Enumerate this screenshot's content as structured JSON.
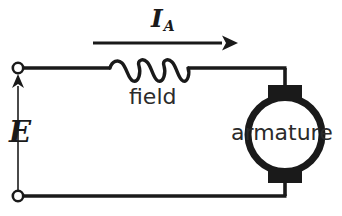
{
  "figure": {
    "background_color": "#ffffff",
    "line_color": "#1a1a1a",
    "width": 342,
    "height": 216
  },
  "labels": {
    "current_symbol": "I",
    "current_subscript": "A",
    "emf_symbol": "E",
    "field_label": "field",
    "armature_label": "armature"
  },
  "components": {
    "field_inductor": {
      "name": "field",
      "type": "inductor",
      "coil_turns": 3
    },
    "armature": {
      "name": "armature",
      "type": "armature-circle",
      "brush_count": 2
    },
    "terminals": {
      "top": "open-terminal-node",
      "bottom": "open-terminal-node",
      "count": 2
    },
    "current_arrow": {
      "direction": "right",
      "represents": "I_A"
    },
    "emf_arrow": {
      "direction": "up",
      "represents": "E"
    }
  },
  "wires": {
    "top_rail": "top-conductor",
    "bottom_rail": "bottom-conductor",
    "left_rail": "source-branch",
    "right_rail": "armature-branch"
  }
}
